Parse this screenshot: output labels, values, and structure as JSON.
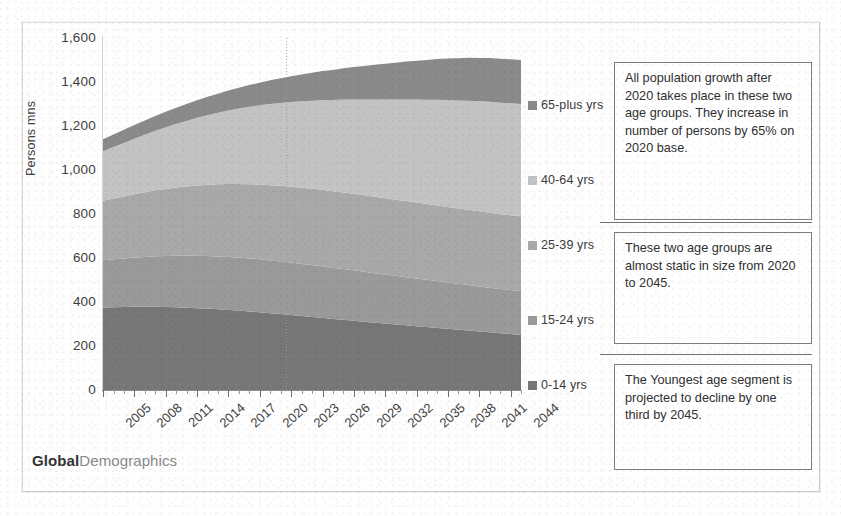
{
  "brand": {
    "bold_part": "Global",
    "light_part": "Demographics"
  },
  "axes": {
    "y_title": "Persons mns",
    "y_ticks": [
      "1,600",
      "1,400",
      "1,200",
      "1,000",
      "800",
      "600",
      "400",
      "200",
      "0"
    ],
    "x_ticks": [
      "2005",
      "2008",
      "2011",
      "2014",
      "2017",
      "2020",
      "2023",
      "2026",
      "2029",
      "2032",
      "2035",
      "2038",
      "2041",
      "2044"
    ]
  },
  "legend": {
    "items": [
      {
        "label": "65-plus yrs",
        "color": "#8a8a8a"
      },
      {
        "label": "40-64 yrs",
        "color": "#c3c3c3"
      },
      {
        "label": "25-39 yrs",
        "color": "#a9a9a9"
      },
      {
        "label": "15-24 yrs",
        "color": "#9a9a9a"
      },
      {
        "label": "0-14 yrs",
        "color": "#777777"
      }
    ]
  },
  "callouts": [
    {
      "id": "callout-growth",
      "text": "All population growth after 2020 takes place in these two age groups. They increase in number of persons by 65% on 2020 base."
    },
    {
      "id": "callout-static",
      "text": "These two age groups are almost static in size from 2020 to 2045."
    },
    {
      "id": "callout-decline",
      "text": "The Youngest age segment is projected to decline by one third by 2045."
    }
  ],
  "chart_data": {
    "type": "area",
    "stacked": true,
    "title": "",
    "xlabel": "",
    "ylabel": "Persons mns",
    "ylim": [
      0,
      1600
    ],
    "grid": false,
    "legend_position": "right",
    "marker_year": 2023,
    "x": [
      2005,
      2006,
      2007,
      2008,
      2009,
      2010,
      2011,
      2012,
      2013,
      2014,
      2015,
      2016,
      2017,
      2018,
      2019,
      2020,
      2021,
      2022,
      2023,
      2024,
      2025,
      2026,
      2027,
      2028,
      2029,
      2030,
      2031,
      2032,
      2033,
      2034,
      2035,
      2036,
      2037,
      2038,
      2039,
      2040,
      2041,
      2042,
      2043,
      2044,
      2045
    ],
    "series": [
      {
        "name": "0-14 yrs",
        "color": "#777777",
        "values": [
          375,
          376,
          377,
          378,
          378,
          378,
          377,
          376,
          374,
          372,
          370,
          367,
          364,
          361,
          357,
          353,
          349,
          345,
          341,
          336,
          332,
          328,
          323,
          319,
          315,
          310,
          306,
          302,
          298,
          294,
          290,
          286,
          282,
          278,
          274,
          270,
          266,
          262,
          258,
          254,
          250
        ]
      },
      {
        "name": "15-24 yrs",
        "color": "#9a9a9a",
        "values": [
          215,
          218,
          221,
          224,
          227,
          230,
          232,
          234,
          236,
          238,
          239,
          240,
          241,
          241,
          241,
          241,
          240,
          239,
          238,
          237,
          236,
          234,
          232,
          231,
          229,
          227,
          225,
          223,
          221,
          219,
          217,
          215,
          213,
          211,
          209,
          207,
          205,
          203,
          201,
          200,
          200
        ]
      },
      {
        "name": "25-39 yrs",
        "color": "#a9a9a9",
        "values": [
          270,
          276,
          282,
          288,
          294,
          300,
          305,
          310,
          315,
          320,
          324,
          328,
          331,
          334,
          337,
          340,
          342,
          344,
          345,
          346,
          347,
          348,
          348,
          348,
          348,
          348,
          347,
          347,
          346,
          346,
          345,
          344,
          344,
          343,
          342,
          342,
          341,
          341,
          340,
          340,
          340
        ]
      },
      {
        "name": "40-64 yrs",
        "color": "#c3c3c3",
        "values": [
          225,
          234,
          243,
          252,
          261,
          270,
          280,
          289,
          298,
          307,
          316,
          325,
          334,
          343,
          352,
          360,
          369,
          377,
          385,
          393,
          400,
          408,
          415,
          422,
          429,
          436,
          443,
          449,
          456,
          462,
          468,
          474,
          480,
          486,
          491,
          496,
          500,
          504,
          507,
          509,
          510
        ]
      },
      {
        "name": "65-plus yrs",
        "color": "#8a8a8a",
        "values": [
          55,
          57,
          60,
          62,
          65,
          68,
          71,
          74,
          77,
          80,
          84,
          87,
          91,
          95,
          99,
          103,
          108,
          112,
          117,
          122,
          127,
          132,
          137,
          142,
          147,
          152,
          157,
          162,
          167,
          172,
          177,
          181,
          185,
          189,
          192,
          195,
          197,
          199,
          200,
          200,
          200
        ]
      }
    ],
    "totals": [
      1140,
      1161,
      1183,
      1204,
      1225,
      1246,
      1265,
      1283,
      1300,
      1317,
      1333,
      1347,
      1361,
      1374,
      1386,
      1397,
      1408,
      1417,
      1426,
      1434,
      1442,
      1450,
      1455,
      1462,
      1468,
      1473,
      1478,
      1483,
      1488,
      1493,
      1497,
      1500,
      1504,
      1507,
      1508,
      1510,
      1509,
      1509,
      1506,
      1503,
      1500
    ]
  }
}
